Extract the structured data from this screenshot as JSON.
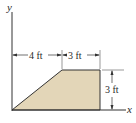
{
  "figure": {
    "axes": {
      "x_label": "x",
      "y_label": "y"
    },
    "dimensions": [
      {
        "id": "horizontal-1",
        "label": "4 ft"
      },
      {
        "id": "horizontal-2",
        "label": "3 ft"
      },
      {
        "id": "vertical",
        "label": "3 ft"
      }
    ],
    "shape": {
      "type": "trapezoid",
      "fill": "#e3d6b8",
      "stroke": "#333333"
    },
    "colors": {
      "line": "#333333",
      "fill": "#e3d6b8",
      "background": "#ffffff"
    }
  }
}
